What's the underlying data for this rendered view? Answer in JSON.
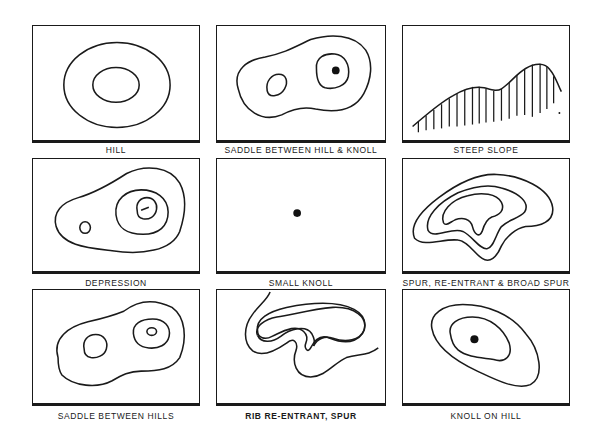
{
  "panels": [
    {
      "id": "hill",
      "label": "HILL"
    },
    {
      "id": "saddle-hill-knoll",
      "label": "SADDLE BETWEEN HILL & KNOLL"
    },
    {
      "id": "steep-slope",
      "label": "STEEP SLOPE"
    },
    {
      "id": "depression",
      "label": "DEPRESSION"
    },
    {
      "id": "small-knoll",
      "label": "SMALL KNOLL"
    },
    {
      "id": "spur-reentrant",
      "label": "SPUR, RE-ENTRANT & BROAD SPUR"
    },
    {
      "id": "saddle-hills",
      "label": "SADDLE BETWEEN HILLS"
    },
    {
      "id": "rib-reentrant",
      "label": "RIB RE-ENTRANT, SPUR"
    },
    {
      "id": "knoll-on-hill",
      "label": "KNOLL ON HILL"
    }
  ],
  "colors": {
    "ink": "#1a1a1a",
    "background": "#ffffff"
  }
}
